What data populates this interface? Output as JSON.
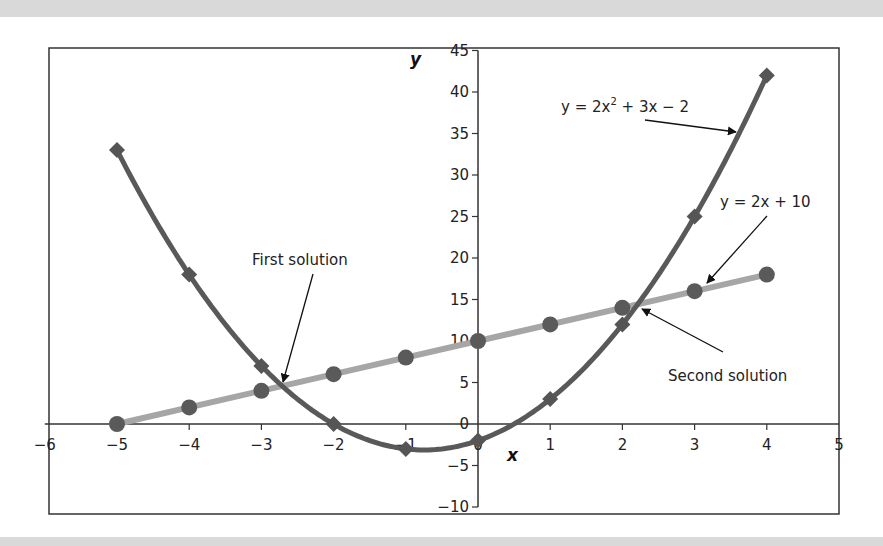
{
  "chart_data": {
    "type": "line",
    "title": "",
    "xlabel": "x",
    "ylabel": "y",
    "xlim": [
      -6,
      5
    ],
    "ylim": [
      -10,
      45
    ],
    "x_ticks": [
      -6,
      -5,
      -4,
      -3,
      -2,
      -1,
      0,
      1,
      2,
      3,
      4,
      5
    ],
    "y_ticks": [
      -10,
      -5,
      0,
      5,
      10,
      15,
      20,
      25,
      30,
      35,
      40,
      45
    ],
    "grid": false,
    "x": [
      -5,
      -4,
      -3,
      -2,
      -1,
      0,
      1,
      2,
      3,
      4
    ],
    "series": [
      {
        "name": "y = 2x² + 3x − 2",
        "marker": "diamond",
        "color": "#595959",
        "smooth": true,
        "values": [
          33,
          18,
          7,
          0,
          -3,
          -2,
          3,
          12,
          25,
          42
        ]
      },
      {
        "name": "y = 2x + 10",
        "marker": "circle",
        "color": "#a6a6a6",
        "smooth": false,
        "values": [
          0,
          2,
          4,
          6,
          8,
          10,
          12,
          14,
          16,
          18
        ]
      }
    ],
    "annotations": [
      {
        "text": "First solution",
        "x": -2.67,
        "y": 4.67
      },
      {
        "text": "Second solution",
        "x": 2.17,
        "y": 14.33
      },
      {
        "text": "y = 2x² + 3x − 2",
        "points_to": "parabola"
      },
      {
        "text": "y = 2x + 10",
        "points_to": "line"
      }
    ]
  },
  "labels": {
    "x_axis": "x",
    "y_axis": "y",
    "first_solution": "First solution",
    "second_solution": "Second solution",
    "eq_parabola_a": "y = 2x",
    "eq_parabola_sup": "2",
    "eq_parabola_b": " + 3x − 2",
    "eq_line": "y = 2x + 10"
  }
}
